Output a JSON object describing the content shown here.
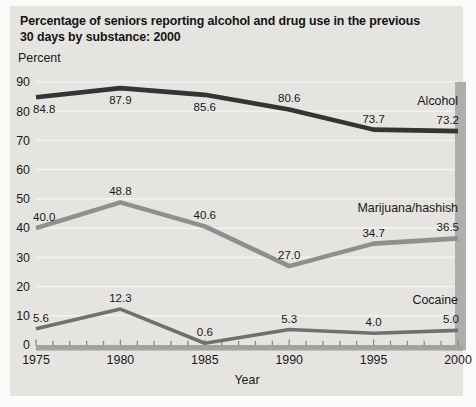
{
  "figure": {
    "title_line1": "Percentage of seniors reporting alcohol and drug use in the previous",
    "title_line2": "30 days by substance: 2000",
    "y_axis_unit_label": "Percent",
    "x_axis_label": "Year"
  },
  "colors": {
    "page_background": "#fbfbf9",
    "figure_background": "#e5e4e1",
    "gridline": "#f2f2ef",
    "axis_bar": "#a2a29f",
    "axis_tick": "#8a8a87",
    "plot_right_shadow": "#aeaeab",
    "text": "#181818",
    "alcohol_line": "#343434",
    "marijuana_line": "#8f8f8d",
    "cocaine_line": "#70706e"
  },
  "chart_data": {
    "type": "line",
    "xlabel": "Year",
    "ylabel": "Percent",
    "x": [
      1975,
      1980,
      1985,
      1990,
      1995,
      2000
    ],
    "x_minor_tick_interval": 1,
    "ylim": [
      0,
      90
    ],
    "yticks": [
      0,
      10,
      20,
      30,
      40,
      50,
      60,
      70,
      80,
      90
    ],
    "grid": true,
    "legend_position": "inline-right",
    "series": [
      {
        "name": "Alcohol",
        "values": [
          84.8,
          87.9,
          85.6,
          80.6,
          73.7,
          73.2
        ],
        "color": "#343434",
        "line_width": 4.6,
        "value_label_side": [
          "below",
          "below",
          "below",
          "above",
          "above",
          "above"
        ]
      },
      {
        "name": "Marijuana/hashish",
        "values": [
          40.0,
          48.8,
          40.6,
          27.0,
          34.7,
          36.5
        ],
        "color": "#8f8f8d",
        "line_width": 4.6,
        "value_label_side": [
          "above",
          "above",
          "above",
          "above",
          "above",
          "above"
        ]
      },
      {
        "name": "Cocaine",
        "values": [
          5.6,
          12.3,
          0.6,
          5.3,
          4.0,
          5.0
        ],
        "color": "#70706e",
        "line_width": 3.6,
        "value_label_side": [
          "above",
          "above",
          "above",
          "above",
          "above",
          "above"
        ]
      }
    ]
  }
}
